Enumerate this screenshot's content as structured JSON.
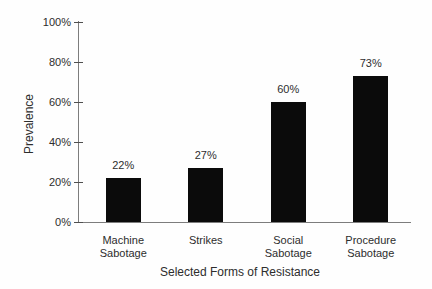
{
  "figure": {
    "xlabel": "Selected Forms of Resistance",
    "ylabel": "Prevalence"
  },
  "chart_data": {
    "type": "bar",
    "title": "",
    "categories": [
      "Machine Sabotage",
      "Strikes",
      "Social Sabotage",
      "Procedure Sabotage"
    ],
    "category_lines": [
      [
        "Machine",
        "Sabotage"
      ],
      [
        "Strikes"
      ],
      [
        "Social",
        "Sabotage"
      ],
      [
        "Procedure",
        "Sabotage"
      ]
    ],
    "values": [
      22,
      27,
      60,
      73
    ],
    "value_labels": [
      "22%",
      "27%",
      "60%",
      "73%"
    ],
    "xlabel": "Selected Forms of Resistance",
    "ylabel": "Prevalence",
    "ylim": [
      0,
      100
    ],
    "ytick_values": [
      0,
      20,
      40,
      60,
      80,
      100
    ],
    "ytick_labels": [
      "0%",
      "20%",
      "40%",
      "60%",
      "80%",
      "100%"
    ],
    "grid": false,
    "legend": null,
    "bar_color": "#0b0b0b",
    "axis_color": "#7d7d7d",
    "text_color": "#2d2d2d"
  }
}
